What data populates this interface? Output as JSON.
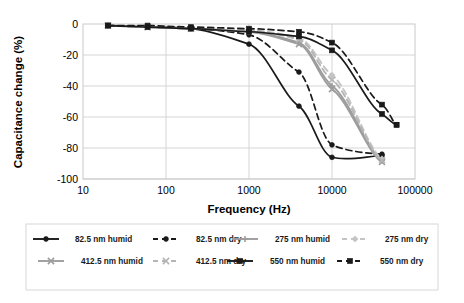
{
  "chart_data": {
    "type": "line",
    "title": "",
    "xlabel": "Frequency (Hz)",
    "ylabel": "Capacitance change (%)",
    "xscale": "log",
    "xlim": [
      10,
      100000
    ],
    "ylim": [
      -100,
      0
    ],
    "yticks": [
      0,
      -20,
      -40,
      -60,
      -80,
      -100
    ],
    "ytick_labels": [
      "0",
      "-20",
      "-40",
      "-60",
      "-80",
      "-100"
    ],
    "xticks": [
      10,
      100,
      1000,
      10000,
      100000
    ],
    "xtick_labels": [
      "10",
      "100",
      "1000",
      "10000",
      "100000"
    ],
    "grid": "horizontal-and-vertical",
    "legend_position": "bottom",
    "series": [
      {
        "name": "82.5 nm humid",
        "color": "#1a1a1a",
        "linestyle": "solid",
        "marker": "circle",
        "x": [
          20,
          60,
          200,
          1000,
          4000,
          10000,
          40000
        ],
        "y": [
          -1,
          -2,
          -3,
          -13,
          -53,
          -86,
          -85
        ]
      },
      {
        "name": "82.5 nm dry",
        "color": "#1a1a1a",
        "linestyle": "dashed",
        "marker": "circle",
        "x": [
          20,
          60,
          200,
          1000,
          4000,
          10000,
          40000
        ],
        "y": [
          -1,
          -2,
          -3,
          -7,
          -31,
          -78,
          -84
        ]
      },
      {
        "name": "275 nm humid",
        "color": "#9d9d9d",
        "linestyle": "solid",
        "marker": "plus",
        "x": [
          20,
          60,
          200,
          1000,
          4000,
          10000,
          40000
        ],
        "y": [
          -1,
          -2,
          -3,
          -5,
          -12,
          -40,
          -88
        ]
      },
      {
        "name": "275 nm dry",
        "color": "#c4c4c4",
        "linestyle": "dashed",
        "marker": "diamond",
        "x": [
          20,
          60,
          200,
          1000,
          4000,
          10000,
          40000
        ],
        "y": [
          -1,
          -2,
          -3,
          -4,
          -9,
          -33,
          -87
        ]
      },
      {
        "name": "412.5 nm humid",
        "color": "#9d9d9d",
        "linestyle": "solid",
        "marker": "cross",
        "x": [
          20,
          60,
          200,
          1000,
          4000,
          10000,
          40000
        ],
        "y": [
          -1,
          -2,
          -3,
          -5,
          -13,
          -42,
          -89
        ]
      },
      {
        "name": "412.5 nm dry",
        "color": "#b5b5b5",
        "linestyle": "dashed",
        "marker": "cross",
        "x": [
          20,
          60,
          200,
          1000,
          4000,
          10000,
          40000
        ],
        "y": [
          -1,
          -2,
          -3,
          -4,
          -10,
          -36,
          -88
        ]
      },
      {
        "name": "550 nm humid",
        "color": "#1a1a1a",
        "linestyle": "solid",
        "marker": "square",
        "x": [
          20,
          60,
          200,
          1000,
          4000,
          10000,
          40000,
          60000
        ],
        "y": [
          -1,
          -2,
          -3,
          -5,
          -8,
          -17,
          -58,
          -65
        ]
      },
      {
        "name": "550 nm dry",
        "color": "#1a1a1a",
        "linestyle": "dashed",
        "marker": "square",
        "x": [
          20,
          60,
          200,
          1000,
          4000,
          10000,
          40000,
          60000
        ],
        "y": [
          -1,
          -1,
          -2,
          -3,
          -5,
          -12,
          -52,
          -65
        ]
      }
    ]
  },
  "legend": {
    "entries": [
      {
        "label": "82.5 nm humid",
        "color": "#1a1a1a",
        "linestyle": "solid",
        "marker": "circle"
      },
      {
        "label": "82.5 nm dry",
        "color": "#1a1a1a",
        "linestyle": "dashed",
        "marker": "circle"
      },
      {
        "label": "275 nm humid",
        "color": "#9d9d9d",
        "linestyle": "solid",
        "marker": "plus"
      },
      {
        "label": "275 nm dry",
        "color": "#c4c4c4",
        "linestyle": "dashed",
        "marker": "diamond"
      },
      {
        "label": "412.5 nm humid",
        "color": "#9d9d9d",
        "linestyle": "solid",
        "marker": "cross"
      },
      {
        "label": "412.5 nm dry",
        "color": "#b5b5b5",
        "linestyle": "dashed",
        "marker": "cross"
      },
      {
        "label": "550 nm humid",
        "color": "#1a1a1a",
        "linestyle": "solid",
        "marker": "square"
      },
      {
        "label": "550 nm dry",
        "color": "#1a1a1a",
        "linestyle": "dashed",
        "marker": "square"
      }
    ]
  }
}
